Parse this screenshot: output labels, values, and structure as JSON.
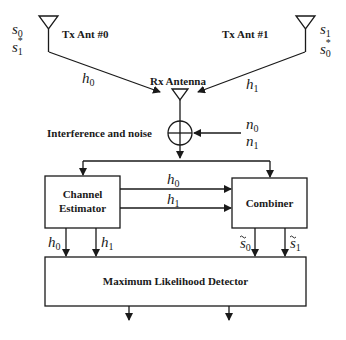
{
  "diagram": {
    "transmitters": [
      {
        "label": "Tx Ant #0",
        "symbols": [
          "s0",
          "s1*"
        ],
        "channel": "h0"
      },
      {
        "label": "Tx Ant #1",
        "symbols": [
          "s1",
          "s0*"
        ],
        "channel": "h1"
      }
    ],
    "receiver": {
      "label": "Rx Antenna"
    },
    "noise": {
      "label": "Interference and noise",
      "inputs": [
        "n0",
        "n1"
      ]
    },
    "blocks": {
      "channel_estimator": {
        "line1": "Channel",
        "line2": "Estimator"
      },
      "combiner": {
        "label": "Combiner"
      },
      "ml_detector": {
        "label": "Maximum Likelihood Detector"
      }
    },
    "signals": {
      "estimator_to_combiner": [
        "h0",
        "h1"
      ],
      "estimator_to_detector": [
        "h0",
        "h1"
      ],
      "combiner_to_detector": [
        "s~0",
        "s~1"
      ]
    },
    "text": {
      "tx0": "Tx Ant #0",
      "tx1": "Tx Ant #1",
      "rx": "Rx Antenna",
      "noise": "Interference and noise",
      "ce1": "Channel",
      "ce2": "Estimator",
      "comb": "Combiner",
      "mld": "Maximum Likelihood Detector",
      "s": "s",
      "h": "h",
      "n": "n",
      "i0": "0",
      "i1": "1",
      "star": "*"
    },
    "colors": {
      "stroke": "#1a1a1a",
      "background": "#ffffff"
    }
  }
}
